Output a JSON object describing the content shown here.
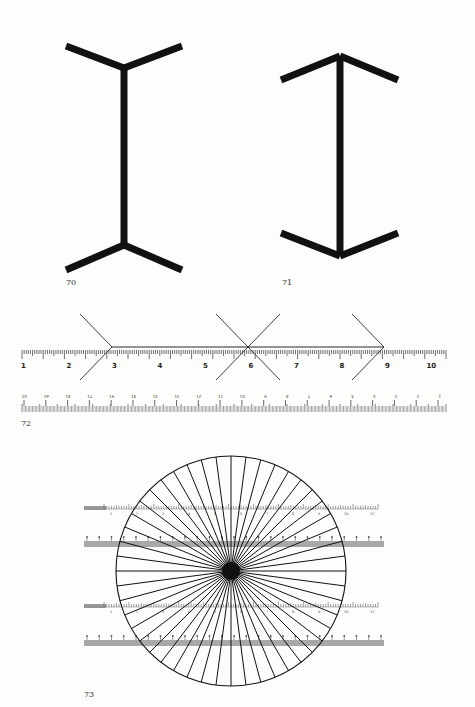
{
  "figures": {
    "fig70": {
      "caption": "70",
      "description": "Müller-Lyer figure with outward fins (tails)",
      "shaft": {
        "x": 124,
        "y1": 68,
        "y2": 245
      },
      "fins_top": [
        [
          66,
          46,
          124,
          68
        ],
        [
          182,
          46,
          124,
          68
        ]
      ],
      "fins_bottom": [
        [
          66,
          270,
          124,
          245
        ],
        [
          182,
          270,
          124,
          245
        ]
      ]
    },
    "fig71": {
      "caption": "71",
      "description": "Müller-Lyer figure with inward fins (arrowheads)",
      "shaft": {
        "x": 340,
        "y1": 56,
        "y2": 256
      },
      "fins_top": [
        [
          281,
          80,
          340,
          56
        ],
        [
          398,
          80,
          340,
          56
        ]
      ],
      "fins_bottom": [
        [
          281,
          233,
          340,
          256
        ],
        [
          398,
          233,
          340,
          256
        ]
      ]
    },
    "fig72": {
      "caption": "72",
      "description": "Müller-Lyer lines drawn over a ruler with numbered scale",
      "ruler_top": {
        "labels": [
          "1",
          "2",
          "3",
          "4",
          "5",
          "6",
          "7",
          "8",
          "9",
          "10"
        ],
        "x_start": 22,
        "x_end": 446,
        "unit_px": 45.5,
        "baseline_y": 356
      },
      "ruler_bottom": {
        "labels": [
          "02",
          "61",
          "81",
          "71",
          "91",
          "51",
          "41",
          "31",
          "21",
          "11",
          "01",
          "9",
          "8",
          "7",
          "6",
          "5",
          "4",
          "3",
          "2",
          "1"
        ],
        "x_start": 22,
        "x_end": 446,
        "y": 404
      },
      "line": {
        "y": 347,
        "points_x": [
          112,
          248,
          384
        ]
      },
      "fins": [
        [
          112,
          347,
          80,
          314
        ],
        [
          112,
          347,
          80,
          380
        ],
        [
          248,
          347,
          280,
          314
        ],
        [
          248,
          347,
          280,
          380
        ],
        [
          248,
          347,
          216,
          314
        ],
        [
          248,
          347,
          216,
          380
        ],
        [
          384,
          347,
          352,
          314
        ],
        [
          384,
          347,
          352,
          380
        ]
      ]
    },
    "fig73": {
      "caption": "73",
      "description": "Radial spoke circle over two pairs of rulers",
      "circle": {
        "cx": 231,
        "cy": 571,
        "r": 115,
        "spokes": 48,
        "hub_r": 9
      },
      "rulers_light": [
        {
          "y": 509,
          "x1": 84,
          "x2": 378
        },
        {
          "y": 607,
          "x1": 84,
          "x2": 378
        }
      ],
      "rulers_grey": [
        {
          "y": 541,
          "x1": 84,
          "x2": 384
        },
        {
          "y": 640,
          "x1": 84,
          "x2": 384
        }
      ],
      "ruler_labels": [
        "1",
        "2",
        "3",
        "4",
        "5",
        "6",
        "7",
        "8",
        "9",
        "10",
        "11"
      ]
    }
  },
  "colors": {
    "ink": "#111111",
    "paper": "#fdfdfb",
    "grey_band": "#a8a8a8",
    "tick": "#333333"
  }
}
